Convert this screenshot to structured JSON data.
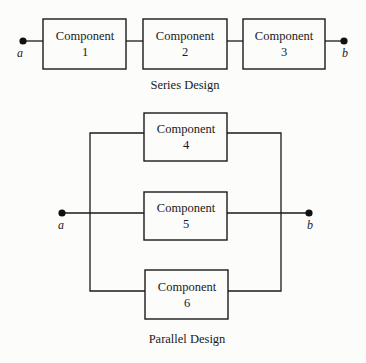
{
  "series": {
    "caption": "Series Design",
    "start_node": "a",
    "end_node": "b",
    "components": [
      {
        "title": "Component",
        "number": "1"
      },
      {
        "title": "Component",
        "number": "2"
      },
      {
        "title": "Component",
        "number": "3"
      }
    ]
  },
  "parallel": {
    "caption": "Parallel Design",
    "start_node": "a",
    "end_node": "b",
    "components": [
      {
        "title": "Component",
        "number": "4"
      },
      {
        "title": "Component",
        "number": "5"
      },
      {
        "title": "Component",
        "number": "6"
      }
    ]
  },
  "colors": {
    "line": "#1a1a1a",
    "background": "#fcfcfb"
  }
}
